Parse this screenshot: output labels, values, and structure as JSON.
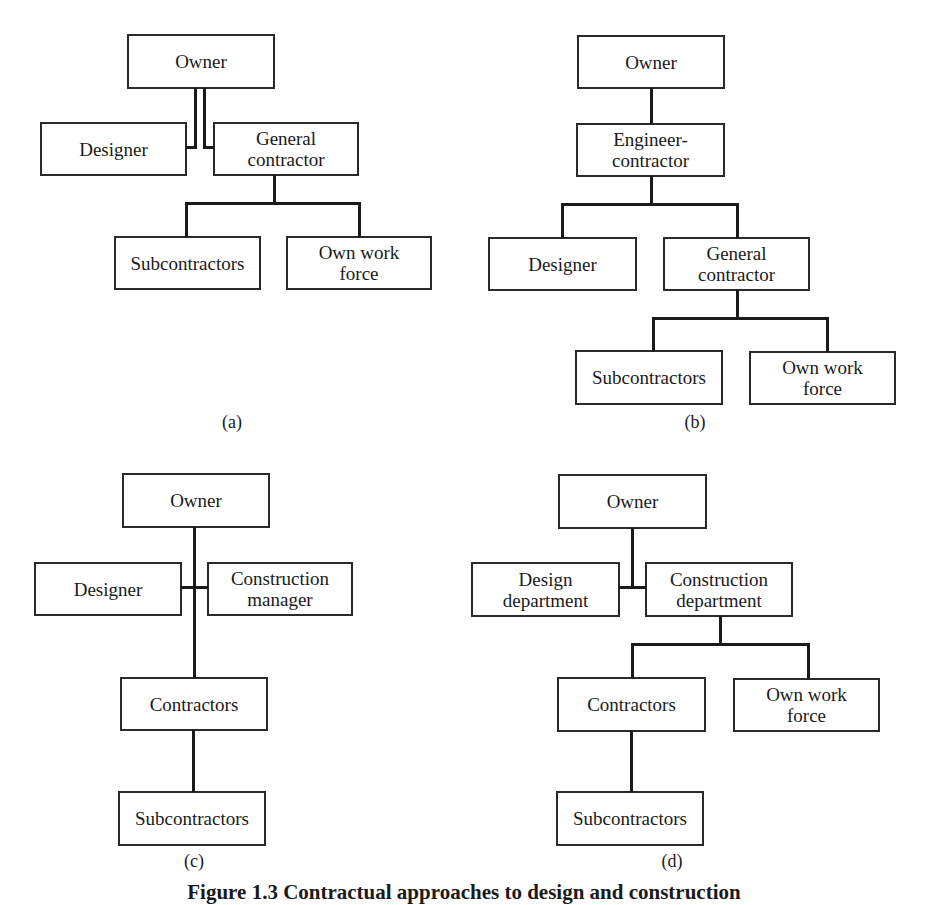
{
  "figure": {
    "caption": "Figure 1.3 Contractual approaches to design and construction",
    "panels": [
      {
        "label": "(a)",
        "nodes": {
          "owner": "Owner",
          "designer": "Designer",
          "general_contractor": "General\ncontractor",
          "subcontractors": "Subcontractors",
          "own_work_force": "Own work\nforce"
        }
      },
      {
        "label": "(b)",
        "nodes": {
          "owner": "Owner",
          "engineer_contractor": "Engineer-\ncontractor",
          "designer": "Designer",
          "general_contractor": "General\ncontractor",
          "subcontractors": "Subcontractors",
          "own_work_force": "Own work\nforce"
        }
      },
      {
        "label": "(c)",
        "nodes": {
          "owner": "Owner",
          "designer": "Designer",
          "construction_manager": "Construction\nmanager",
          "contractors": "Contractors",
          "subcontractors": "Subcontractors"
        }
      },
      {
        "label": "(d)",
        "nodes": {
          "owner": "Owner",
          "design_department": "Design\ndepartment",
          "construction_department": "Construction\ndepartment",
          "contractors": "Contractors",
          "own_work_force": "Own work\nforce",
          "subcontractors": "Subcontractors"
        }
      }
    ]
  }
}
